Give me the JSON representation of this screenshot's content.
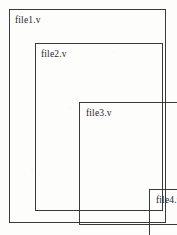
{
  "diagram": {
    "background_color": "#fdfdfc",
    "border_color": "#3a3a3a",
    "text_color": "#262626",
    "boxes": [
      {
        "id": "box-1",
        "label": "file1.v",
        "level": 1
      },
      {
        "id": "box-2",
        "label": "file2.v",
        "level": 2
      },
      {
        "id": "box-3",
        "label": "file3.v",
        "level": 3
      },
      {
        "id": "box-4",
        "label": "file4.v",
        "level": 4
      }
    ]
  }
}
